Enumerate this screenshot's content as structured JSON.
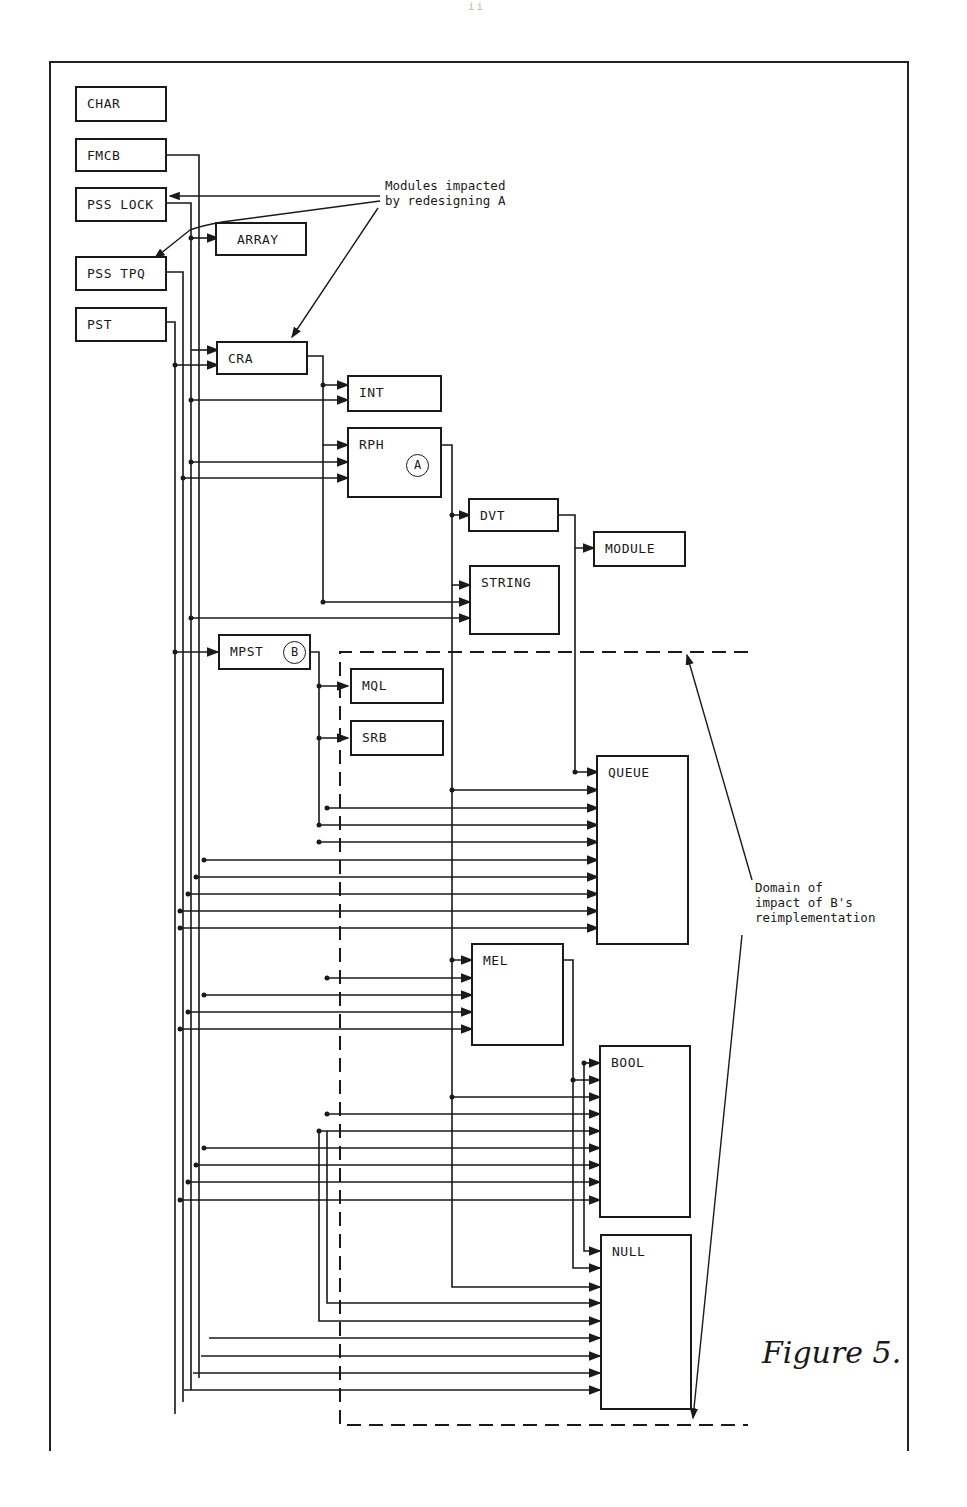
{
  "page_number": "ii",
  "figure": {
    "caption": "Figure 5.",
    "annotations": {
      "impacted_A": "Modules impacted\nby redesigning A",
      "domain_B": "Domain of\nimpact of B's\nreimplementation"
    },
    "markers": {
      "A": "A",
      "B": "B"
    }
  },
  "modules": [
    {
      "id": "char",
      "label": "CHAR"
    },
    {
      "id": "fmcb",
      "label": "FMCB"
    },
    {
      "id": "pss_lock",
      "label": "PSS LOCK"
    },
    {
      "id": "array",
      "label": "ARRAY"
    },
    {
      "id": "pss_tpq",
      "label": "PSS TPQ"
    },
    {
      "id": "pst",
      "label": "PST"
    },
    {
      "id": "cra",
      "label": "CRA"
    },
    {
      "id": "int",
      "label": "INT"
    },
    {
      "id": "rph",
      "label": "RPH"
    },
    {
      "id": "dvt",
      "label": "DVT"
    },
    {
      "id": "module",
      "label": "MODULE"
    },
    {
      "id": "string",
      "label": "STRING"
    },
    {
      "id": "mpst",
      "label": "MPST"
    },
    {
      "id": "mql",
      "label": "MQL"
    },
    {
      "id": "srb",
      "label": "SRB"
    },
    {
      "id": "queue",
      "label": "QUEUE"
    },
    {
      "id": "mel",
      "label": "MEL"
    },
    {
      "id": "bool",
      "label": "BOOL"
    },
    {
      "id": "null",
      "label": "NULL"
    }
  ],
  "dependencies": [
    [
      "pss_lock",
      "array"
    ],
    [
      "pss_lock",
      "cra"
    ],
    [
      "pst",
      "cra"
    ],
    [
      "cra",
      "int"
    ],
    [
      "pss_lock",
      "int"
    ],
    [
      "cra",
      "rph"
    ],
    [
      "pss_lock",
      "rph"
    ],
    [
      "pss_tpq",
      "rph"
    ],
    [
      "rph",
      "dvt"
    ],
    [
      "dvt",
      "module"
    ],
    [
      "rph",
      "string"
    ],
    [
      "cra",
      "string"
    ],
    [
      "pss_lock",
      "string"
    ],
    [
      "pst",
      "mpst"
    ],
    [
      "mpst",
      "mql"
    ],
    [
      "mpst",
      "srb"
    ],
    [
      "dvt",
      "queue"
    ],
    [
      "rph",
      "queue"
    ],
    [
      "mpst",
      "queue"
    ],
    [
      "cra",
      "queue"
    ],
    [
      "rph",
      "mel"
    ],
    [
      "mel",
      "bool"
    ],
    [
      "mel",
      "null"
    ],
    [
      "dvt",
      "bool"
    ],
    [
      "dvt",
      "null"
    ],
    [
      "fmcb",
      "queue"
    ],
    [
      "pss_lock",
      "queue"
    ],
    [
      "pss_tpq",
      "queue"
    ],
    [
      "pst",
      "queue"
    ],
    [
      "fmcb",
      "bool"
    ],
    [
      "pss_lock",
      "bool"
    ],
    [
      "pss_tpq",
      "bool"
    ],
    [
      "pst",
      "bool"
    ],
    [
      "fmcb",
      "null"
    ],
    [
      "pss_lock",
      "null"
    ],
    [
      "pss_tpq",
      "null"
    ],
    [
      "pst",
      "null"
    ],
    [
      "cra",
      "null"
    ],
    [
      "mpst",
      "null"
    ],
    [
      "rph",
      "null"
    ]
  ]
}
